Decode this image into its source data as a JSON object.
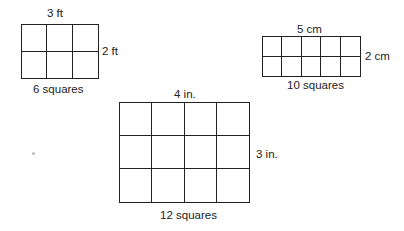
{
  "figures": [
    {
      "id": "rect-feet",
      "width_label": "3 ft",
      "height_label": "2 ft",
      "count_label": "6 squares",
      "cols": 3,
      "rows": 2
    },
    {
      "id": "rect-cm",
      "width_label": "5 cm",
      "height_label": "2 cm",
      "count_label": "10 squares",
      "cols": 5,
      "rows": 2
    },
    {
      "id": "rect-inches",
      "width_label": "4 in.",
      "height_label": "3 in.",
      "count_label": "12 squares",
      "cols": 4,
      "rows": 3
    }
  ]
}
